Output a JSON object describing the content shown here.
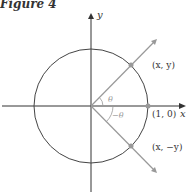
{
  "figure": {
    "title": "Figure 4",
    "labels": {
      "y_axis": "y",
      "x_axis": "x",
      "point_upper": "(x, y)",
      "point_lower": "(x, −y)",
      "point_axis": "(1, 0)",
      "angle_upper": "θ",
      "angle_lower": "−θ"
    },
    "colors": {
      "axis": "#333333",
      "circle": "#444444",
      "ray": "#999999",
      "point": "#999999",
      "text": "#333333",
      "angle_text": "#999999"
    }
  }
}
